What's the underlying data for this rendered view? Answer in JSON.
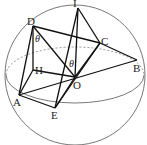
{
  "diagram": {
    "type": "sphere-geometry",
    "points": {
      "I": {
        "label": "I",
        "x": 78,
        "y": 8
      },
      "D": {
        "label": "D",
        "x": 33,
        "y": 26
      },
      "C": {
        "label": "C",
        "x": 100,
        "y": 43
      },
      "B": {
        "label": "B",
        "x": 137,
        "y": 60
      },
      "H": {
        "label": "H",
        "x": 33,
        "y": 70
      },
      "O": {
        "label": "O",
        "x": 75,
        "y": 77
      },
      "A": {
        "label": "A",
        "x": 19,
        "y": 95
      },
      "E": {
        "label": "E",
        "x": 55,
        "y": 108
      }
    },
    "angles": [
      {
        "label": "θ",
        "at": "D"
      },
      {
        "label": "θ",
        "at": "O"
      }
    ],
    "segments": [
      "DA",
      "DH",
      "HO",
      "HA",
      "DC",
      "DO",
      "DB",
      "IO",
      "IE",
      "IC",
      "CO",
      "CE",
      "AB",
      "AE",
      "AO",
      "EO"
    ]
  }
}
